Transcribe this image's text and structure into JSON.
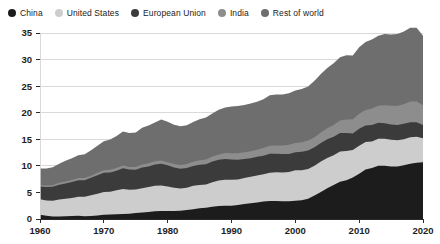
{
  "legend": {
    "position": "top-left",
    "items": [
      {
        "label": "China",
        "color": "#1c1c1c",
        "icon": "circle-swatch-icon"
      },
      {
        "label": "United States",
        "color": "#cdcdcd",
        "icon": "circle-swatch-icon"
      },
      {
        "label": "European Union",
        "color": "#3b3b3b",
        "icon": "circle-swatch-icon"
      },
      {
        "label": "India",
        "color": "#8d8d8d",
        "icon": "circle-swatch-icon"
      },
      {
        "label": "Rest of world",
        "color": "#6e6e6e",
        "icon": "circle-swatch-icon"
      }
    ]
  },
  "chart_data": {
    "type": "area",
    "stacked": true,
    "title": "",
    "subtitle": "",
    "xlabel": "",
    "ylabel": "",
    "xlim": [
      1960,
      2020
    ],
    "ylim": [
      0,
      35
    ],
    "grid": true,
    "xticks": [
      1960,
      1970,
      1980,
      1990,
      2000,
      2010,
      2020
    ],
    "yticks": [
      0,
      5,
      10,
      15,
      20,
      25,
      30,
      35
    ],
    "x": [
      1960,
      1961,
      1962,
      1963,
      1964,
      1965,
      1966,
      1967,
      1968,
      1969,
      1970,
      1971,
      1972,
      1973,
      1974,
      1975,
      1976,
      1977,
      1978,
      1979,
      1980,
      1981,
      1982,
      1983,
      1984,
      1985,
      1986,
      1987,
      1988,
      1989,
      1990,
      1991,
      1992,
      1993,
      1994,
      1995,
      1996,
      1997,
      1998,
      1999,
      2000,
      2001,
      2002,
      2003,
      2004,
      2005,
      2006,
      2007,
      2008,
      2009,
      2010,
      2011,
      2012,
      2013,
      2014,
      2015,
      2016,
      2017,
      2018,
      2019,
      2020
    ],
    "series": [
      {
        "name": "China",
        "color": "#1c1c1c",
        "values": [
          0.8,
          0.6,
          0.45,
          0.45,
          0.5,
          0.55,
          0.6,
          0.5,
          0.55,
          0.65,
          0.8,
          0.85,
          0.9,
          0.95,
          1.0,
          1.15,
          1.2,
          1.3,
          1.45,
          1.5,
          1.5,
          1.5,
          1.55,
          1.7,
          1.85,
          2.0,
          2.1,
          2.3,
          2.45,
          2.5,
          2.5,
          2.65,
          2.8,
          2.95,
          3.1,
          3.3,
          3.4,
          3.4,
          3.35,
          3.35,
          3.45,
          3.55,
          3.8,
          4.4,
          5.1,
          5.8,
          6.4,
          7.0,
          7.3,
          7.8,
          8.5,
          9.3,
          9.6,
          10.0,
          10.0,
          9.9,
          9.9,
          10.1,
          10.4,
          10.6,
          10.7
        ]
      },
      {
        "name": "United States",
        "color": "#cdcdcd",
        "values": [
          2.9,
          2.9,
          3.0,
          3.2,
          3.3,
          3.4,
          3.6,
          3.7,
          3.9,
          4.1,
          4.3,
          4.3,
          4.5,
          4.7,
          4.5,
          4.4,
          4.6,
          4.7,
          4.8,
          4.8,
          4.6,
          4.4,
          4.2,
          4.2,
          4.4,
          4.4,
          4.4,
          4.6,
          4.8,
          4.9,
          4.9,
          4.8,
          4.9,
          5.0,
          5.1,
          5.1,
          5.3,
          5.4,
          5.4,
          5.5,
          5.7,
          5.6,
          5.6,
          5.6,
          5.7,
          5.7,
          5.6,
          5.7,
          5.5,
          5.2,
          5.3,
          5.2,
          5.0,
          5.1,
          5.1,
          5.0,
          4.9,
          4.9,
          5.0,
          4.9,
          4.5
        ]
      },
      {
        "name": "European Union",
        "color": "#3b3b3b",
        "values": [
          2.4,
          2.5,
          2.6,
          2.8,
          2.9,
          3.0,
          3.1,
          3.1,
          3.3,
          3.5,
          3.6,
          3.6,
          3.7,
          3.9,
          3.8,
          3.7,
          3.9,
          3.9,
          4.0,
          4.1,
          4.0,
          3.8,
          3.7,
          3.7,
          3.7,
          3.8,
          3.8,
          3.9,
          3.9,
          3.9,
          3.8,
          3.7,
          3.6,
          3.5,
          3.5,
          3.5,
          3.6,
          3.5,
          3.5,
          3.4,
          3.4,
          3.5,
          3.5,
          3.5,
          3.5,
          3.5,
          3.5,
          3.5,
          3.4,
          3.1,
          3.2,
          3.1,
          3.1,
          3.0,
          2.9,
          2.9,
          2.9,
          2.9,
          2.8,
          2.7,
          2.5
        ]
      },
      {
        "name": "India",
        "color": "#8d8d8d",
        "values": [
          0.3,
          0.3,
          0.3,
          0.35,
          0.35,
          0.4,
          0.4,
          0.4,
          0.4,
          0.45,
          0.45,
          0.5,
          0.5,
          0.5,
          0.5,
          0.55,
          0.55,
          0.6,
          0.6,
          0.6,
          0.6,
          0.65,
          0.7,
          0.75,
          0.8,
          0.85,
          0.9,
          0.95,
          1.0,
          1.1,
          1.15,
          1.2,
          1.25,
          1.3,
          1.35,
          1.45,
          1.5,
          1.55,
          1.6,
          1.7,
          1.75,
          1.8,
          1.85,
          1.9,
          2.0,
          2.1,
          2.2,
          2.35,
          2.5,
          2.65,
          2.8,
          2.9,
          3.1,
          3.2,
          3.4,
          3.5,
          3.6,
          3.7,
          3.9,
          3.9,
          3.7
        ]
      },
      {
        "name": "Rest of world",
        "color": "#6e6e6e",
        "values": [
          3.1,
          3.2,
          3.4,
          3.6,
          3.9,
          4.1,
          4.3,
          4.5,
          4.8,
          5.1,
          5.5,
          5.7,
          6.0,
          6.4,
          6.4,
          6.5,
          6.9,
          7.1,
          7.3,
          7.7,
          7.6,
          7.4,
          7.3,
          7.3,
          7.5,
          7.7,
          7.9,
          8.1,
          8.4,
          8.6,
          8.8,
          8.9,
          8.9,
          9.0,
          9.0,
          9.2,
          9.5,
          9.6,
          9.6,
          9.7,
          9.9,
          10.0,
          10.2,
          10.6,
          11.0,
          11.3,
          11.6,
          11.9,
          12.1,
          12.0,
          12.5,
          12.8,
          13.0,
          13.2,
          13.4,
          13.4,
          13.5,
          13.7,
          13.9,
          13.9,
          13.1
        ]
      }
    ]
  }
}
